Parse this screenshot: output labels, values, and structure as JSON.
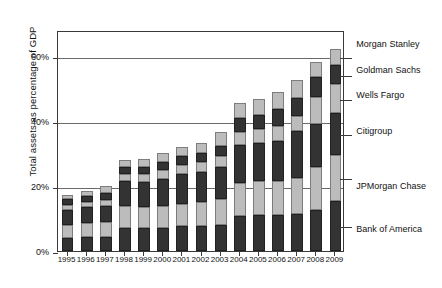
{
  "chart_data": {
    "type": "bar",
    "title": "",
    "xlabel": "",
    "ylabel": "Total assets as percentage of GDP",
    "ylim": [
      0,
      68
    ],
    "yticks": [
      0,
      20,
      40,
      60
    ],
    "ytick_labels": [
      "0%",
      "20%",
      "40%",
      "60%"
    ],
    "grid": true,
    "stacked": true,
    "legend_position": "right",
    "categories": [
      "1995",
      "1996",
      "1997",
      "1998",
      "1999",
      "2000",
      "2001",
      "2002",
      "2003",
      "2004",
      "2005",
      "2006",
      "2007",
      "2008",
      "2009"
    ],
    "series": [
      {
        "name": "Bank of America",
        "color": "#333333",
        "values": [
          4.0,
          4.2,
          4.3,
          7.2,
          7.0,
          7.2,
          7.6,
          7.6,
          8.0,
          10.9,
          11.2,
          11.0,
          11.5,
          12.6,
          15.3
        ]
      },
      {
        "name": "JPMorgan Chase",
        "color": "#bcbcbc",
        "values": [
          4.1,
          4.3,
          4.5,
          6.6,
          6.5,
          6.8,
          7.0,
          7.5,
          8.0,
          9.9,
          10.2,
          10.6,
          11.0,
          13.2,
          14.3
        ]
      },
      {
        "name": "Citigroup",
        "color": "#333333",
        "values": [
          4.6,
          4.9,
          5.2,
          7.6,
          7.7,
          8.3,
          9.1,
          9.3,
          9.9,
          11.9,
          11.8,
          12.4,
          14.3,
          13.4,
          12.8
        ]
      },
      {
        "name": "Wells Fargo",
        "color": "#bcbcbc",
        "values": [
          1.5,
          1.6,
          1.8,
          2.2,
          2.4,
          2.6,
          2.7,
          2.9,
          3.2,
          4.0,
          4.2,
          4.4,
          4.6,
          8.2,
          8.9
        ]
      },
      {
        "name": "Goldman Sachs",
        "color": "#333333",
        "values": [
          1.7,
          1.8,
          2.1,
          2.3,
          2.4,
          2.6,
          2.8,
          2.9,
          3.3,
          4.2,
          4.6,
          5.2,
          5.6,
          6.0,
          5.8
        ]
      },
      {
        "name": "Morgan Stanley",
        "color": "#bcbcbc",
        "values": [
          1.4,
          1.6,
          2.0,
          2.1,
          2.3,
          2.6,
          2.8,
          2.9,
          4.2,
          4.7,
          4.9,
          5.3,
          5.6,
          4.9,
          5.0
        ]
      }
    ],
    "totals": [
      17.3,
      18.4,
      19.9,
      28.0,
      28.3,
      30.1,
      32.0,
      33.1,
      36.6,
      45.6,
      46.9,
      48.9,
      52.6,
      58.3,
      62.1
    ]
  },
  "legend": {
    "entries": [
      {
        "label": "Morgan Stanley"
      },
      {
        "label": "Goldman Sachs"
      },
      {
        "label": "Wells Fargo"
      },
      {
        "label": "Citigroup"
      },
      {
        "label": "JPMorgan Chase"
      },
      {
        "label": "Bank of America"
      }
    ]
  },
  "caption": ""
}
